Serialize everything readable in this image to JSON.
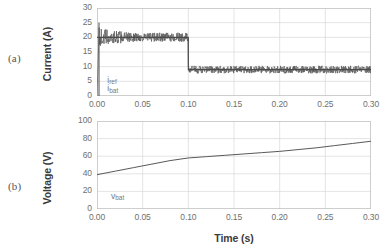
{
  "figure": {
    "panel_a_tag": "(a)",
    "panel_b_tag": "(b)",
    "background": "#ffffff",
    "grid_color": "#d9d9d9",
    "axis_color": "#bfbfbf",
    "trace_color": "#595959",
    "tick_color": "#6f6f6f"
  },
  "chart_data": [
    {
      "type": "line",
      "id": "panel-a-current",
      "panel": "(a)",
      "title": "",
      "xlabel": "",
      "ylabel": "Current (A)",
      "xlim": [
        0.0,
        0.3
      ],
      "ylim": [
        0,
        30
      ],
      "xticks": [
        "0.00",
        "0.05",
        "0.10",
        "0.15",
        "0.20",
        "0.25",
        "0.30"
      ],
      "xtick_values": [
        0.0,
        0.05,
        0.1,
        0.15,
        0.2,
        0.25,
        0.3
      ],
      "yticks": [
        "0",
        "5",
        "10",
        "15",
        "20",
        "25",
        "30"
      ],
      "ytick_values": [
        0,
        5,
        10,
        15,
        20,
        25,
        30
      ],
      "grid": true,
      "legend_position": "inside-lower-left",
      "annotations": [
        {
          "text": "i_ref",
          "base": "i",
          "sub": "ref",
          "x": 0.008,
          "y": 5.2
        },
        {
          "text": "i_bat",
          "base": "i",
          "sub": "bat",
          "x": 0.008,
          "y": 2.3
        }
      ],
      "series": [
        {
          "name": "i_ref",
          "description": "Reference current step: 20 A until t=0.10 s then 9 A",
          "x": [
            0.0,
            0.0999,
            0.1001,
            0.3
          ],
          "values": [
            20,
            20,
            9,
            9
          ]
        },
        {
          "name": "i_bat",
          "description": "Measured battery current, noisy band tracking the reference; initial transient spike to 25 A at t=0",
          "x": [
            0.0,
            0.002,
            0.01,
            0.02,
            0.03,
            0.04,
            0.05,
            0.06,
            0.07,
            0.08,
            0.09,
            0.0999,
            0.1001,
            0.11,
            0.13,
            0.15,
            0.17,
            0.19,
            0.21,
            0.23,
            0.25,
            0.27,
            0.29,
            0.3
          ],
          "values": [
            0,
            25,
            20,
            20,
            20,
            20,
            20,
            20,
            20,
            20,
            20,
            20,
            9,
            9,
            9,
            9,
            9,
            9,
            9,
            9,
            9,
            9,
            9,
            9
          ],
          "ripple_amplitude_before_step": 1.6,
          "ripple_amplitude_after_step": 1.3
        }
      ]
    },
    {
      "type": "line",
      "id": "panel-b-voltage",
      "panel": "(b)",
      "title": "",
      "xlabel": "Time (s)",
      "ylabel": "Voltage (V)",
      "xlim": [
        0.0,
        0.3
      ],
      "ylim": [
        0,
        100
      ],
      "xticks": [
        "0.00",
        "0.05",
        "0.10",
        "0.15",
        "0.20",
        "0.25",
        "0.30"
      ],
      "xtick_values": [
        0.0,
        0.05,
        0.1,
        0.15,
        0.2,
        0.25,
        0.3
      ],
      "yticks": [
        "0",
        "20",
        "40",
        "60",
        "80",
        "100"
      ],
      "ytick_values": [
        0,
        20,
        40,
        60,
        80,
        100
      ],
      "grid": true,
      "legend_position": "inside-lower-left",
      "annotations": [
        {
          "text": "v_bat",
          "base": "v",
          "sub": "bat",
          "x": 0.012,
          "y": 14
        }
      ],
      "series": [
        {
          "name": "v_bat",
          "description": "Battery voltage rising from 39 V, knee near t=0.10 s at 58 V, reaching 77 V at t=0.30 s",
          "x": [
            0.0,
            0.02,
            0.04,
            0.06,
            0.08,
            0.1,
            0.12,
            0.14,
            0.16,
            0.18,
            0.2,
            0.22,
            0.24,
            0.26,
            0.28,
            0.3
          ],
          "values": [
            39,
            43,
            47,
            51,
            55,
            58,
            59.5,
            61,
            62.5,
            64,
            65.5,
            67.5,
            69.5,
            72,
            74.5,
            77
          ]
        }
      ]
    }
  ]
}
